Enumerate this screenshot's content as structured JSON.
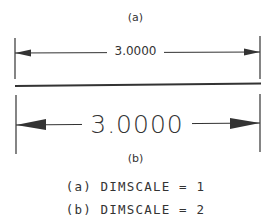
{
  "figure": {
    "caption_a": "(a)",
    "caption_b": "(b)",
    "dimension_a": {
      "value": "3.0000",
      "scale": 1
    },
    "dimension_b": {
      "value": "3.0000",
      "scale": 2
    },
    "notes": [
      "(a) DIMSCALE = 1",
      "(b) DIMSCALE = 2"
    ],
    "line_color": "#333333"
  }
}
